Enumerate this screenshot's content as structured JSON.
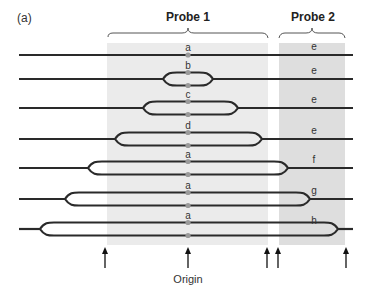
{
  "figure": {
    "panel_label": "(a)",
    "probe1_title": "Probe 1",
    "probe2_title": "Probe 2",
    "origin_label": "Origin",
    "colors": {
      "line": "#2a2a2a",
      "probe1_shade": "#ebebeb",
      "probe2_shade": "#dedede",
      "dot": "#9a9a9a"
    }
  },
  "rows": [
    {
      "y": 55,
      "bubble": null,
      "center_label": "a",
      "probe2_label": "e"
    },
    {
      "y": 79,
      "bubble": [
        163,
        213
      ],
      "center_label": "b",
      "probe2_label": "e"
    },
    {
      "y": 108,
      "bubble": [
        143,
        238
      ],
      "center_label": "c",
      "probe2_label": "e"
    },
    {
      "y": 139,
      "bubble": [
        115,
        262
      ],
      "center_label": "d",
      "probe2_label": "e"
    },
    {
      "y": 168,
      "bubble": [
        88,
        288
      ],
      "center_label": "a",
      "probe2_label": "f"
    },
    {
      "y": 199,
      "bubble": [
        65,
        310
      ],
      "center_label": "a",
      "probe2_label": "g"
    },
    {
      "y": 229,
      "bubble": [
        40,
        338
      ],
      "center_label": "a",
      "probe2_label": "h"
    }
  ],
  "arrows_x": [
    105,
    188,
    267,
    278,
    346
  ]
}
